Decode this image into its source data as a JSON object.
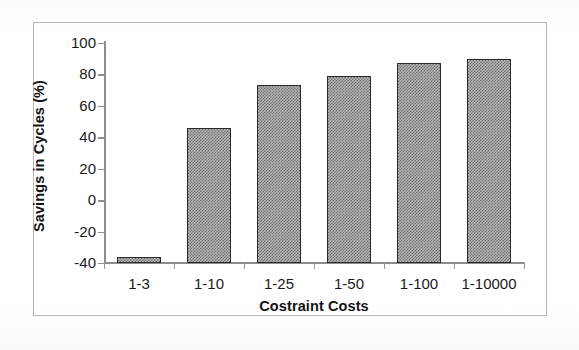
{
  "chart_data": {
    "type": "bar",
    "title": "",
    "xlabel": "Costraint Costs",
    "ylabel": "Savings in Cycles (%)",
    "categories": [
      "1-3",
      "1-10",
      "1-25",
      "1-50",
      "1-100",
      "1-10000"
    ],
    "values": [
      -36,
      46,
      73,
      79,
      87,
      90
    ],
    "ylim": [
      -40,
      100
    ],
    "ytick_step": 20,
    "ytick_labels": [
      "100",
      "80",
      "60",
      "40",
      "20",
      "0",
      "-20",
      "-40"
    ],
    "ytick_values": [
      100,
      80,
      60,
      40,
      20,
      0,
      -20,
      -40
    ],
    "grid": false,
    "legend": false,
    "legend_position": "none",
    "series": [
      {
        "name": "Savings in Cycles (%)",
        "values": [
          -36,
          46,
          73,
          79,
          87,
          90
        ]
      }
    ]
  },
  "style": {
    "bar_fill": "#b5b5b5",
    "bar_pattern": "#6e6e6e",
    "bar_border": "#2a2a2a",
    "axis_color": "#8d8d8d",
    "text_color": "#1a1a1a",
    "frame_color": "#b9b9b9",
    "background": "#ffffff"
  }
}
